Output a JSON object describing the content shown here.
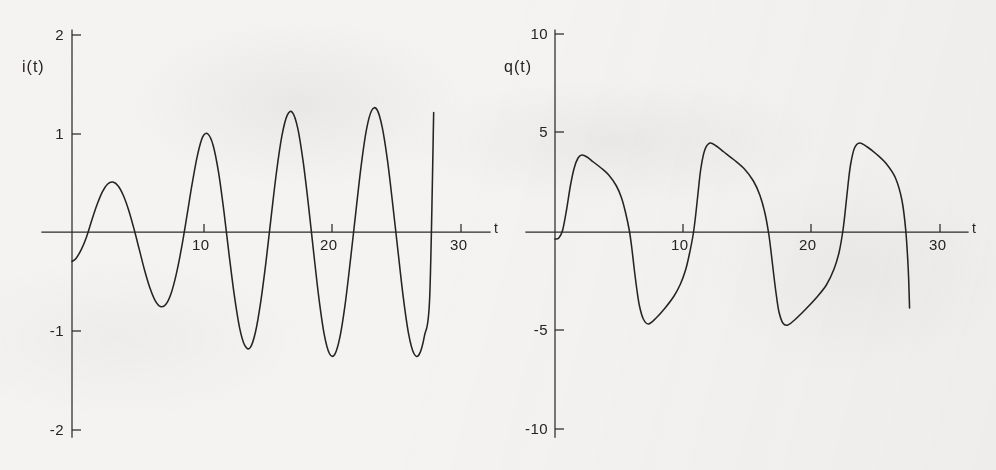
{
  "figure": {
    "background_color": "#f4f3f1",
    "ink_color": "#262422",
    "panel_count": 2
  },
  "panels": [
    {
      "id": "current",
      "ylabel": "i(t)",
      "xlabel": "t",
      "y_ticks": [
        "2",
        "1",
        "-1",
        "-2"
      ],
      "x_ticks": [
        "10",
        "20",
        "30"
      ]
    },
    {
      "id": "charge",
      "ylabel": "q(t)",
      "xlabel": "t",
      "y_ticks": [
        "10",
        "5",
        "-5",
        "-10"
      ],
      "x_ticks": [
        "10",
        "20",
        "30"
      ]
    }
  ],
  "chart_data": [
    {
      "type": "line",
      "id": "current-waveform",
      "title": "",
      "xlabel": "t",
      "ylabel": "i(t)",
      "xlim": [
        0,
        31
      ],
      "ylim": [
        -2,
        2
      ],
      "x_ticks": [
        10,
        20,
        30
      ],
      "y_ticks": [
        2,
        1,
        -1,
        -2
      ],
      "grid": false,
      "legend": "none",
      "series": [
        {
          "name": "i(t)",
          "comment": "growing oscillation settling to steady amplitude ~1.22, period ~6.9",
          "x": [
            0.0,
            0.3,
            0.7,
            1.1,
            1.5,
            1.9,
            2.3,
            2.7,
            3.1,
            3.5,
            3.9,
            4.3,
            4.7,
            5.1,
            5.5,
            5.9,
            6.3,
            6.7,
            7.1,
            7.5,
            7.9,
            8.3,
            8.7,
            9.1,
            9.5,
            9.9,
            10.3,
            10.7,
            11.1,
            11.5,
            11.9,
            12.3,
            12.7,
            13.1,
            13.5,
            13.9,
            14.3,
            14.7,
            15.1,
            15.5,
            15.9,
            16.3,
            16.7,
            17.1,
            17.5,
            17.9,
            18.3,
            18.7,
            19.1,
            19.5,
            19.9,
            20.3,
            20.7,
            21.1,
            21.5,
            21.9,
            22.3,
            22.7,
            23.1,
            23.5,
            23.9,
            24.3,
            24.7,
            25.1,
            25.5,
            25.9,
            26.3,
            26.7,
            27.1,
            27.4
          ],
          "y": [
            -0.3,
            -0.27,
            -0.18,
            -0.05,
            0.12,
            0.28,
            0.41,
            0.49,
            0.51,
            0.47,
            0.37,
            0.22,
            0.03,
            -0.18,
            -0.39,
            -0.57,
            -0.7,
            -0.76,
            -0.74,
            -0.63,
            -0.43,
            -0.16,
            0.16,
            0.49,
            0.78,
            0.97,
            1.0,
            0.88,
            0.61,
            0.22,
            -0.23,
            -0.65,
            -0.98,
            -1.16,
            -1.18,
            -1.02,
            -0.71,
            -0.3,
            0.17,
            0.62,
            0.98,
            1.19,
            1.22,
            1.06,
            0.73,
            0.29,
            -0.2,
            -0.67,
            -1.04,
            -1.24,
            -1.25,
            -1.07,
            -0.73,
            -0.28,
            0.2,
            0.67,
            1.04,
            1.24,
            1.25,
            1.07,
            0.73,
            0.28,
            -0.2,
            -0.67,
            -1.04,
            -1.24,
            -1.25,
            -1.06,
            -0.66,
            1.22
          ]
        }
      ]
    },
    {
      "type": "line",
      "id": "charge-waveform",
      "title": "",
      "xlabel": "t",
      "ylabel": "q(t)",
      "xlim": [
        0,
        31
      ],
      "ylim": [
        -10,
        10
      ],
      "x_ticks": [
        10,
        20,
        30
      ],
      "y_ticks": [
        10,
        5,
        -5,
        -10
      ],
      "grid": false,
      "legend": "none",
      "series": [
        {
          "name": "q(t)",
          "comment": "relaxation oscillation: fast rise to ~+4.5, slow decay, fast fall to ~-4.7, slow recovery; period ~11.3",
          "x": [
            0.0,
            0.3,
            0.6,
            0.9,
            1.2,
            1.5,
            1.8,
            2.1,
            2.5,
            3.0,
            3.6,
            4.2,
            4.8,
            5.2,
            5.5,
            5.8,
            6.0,
            6.2,
            6.4,
            6.6,
            6.9,
            7.3,
            7.9,
            8.6,
            9.3,
            9.8,
            10.2,
            10.5,
            10.8,
            11.0,
            11.2,
            11.4,
            11.7,
            12.1,
            12.6,
            13.2,
            14.0,
            14.8,
            15.5,
            16.0,
            16.4,
            16.7,
            16.9,
            17.1,
            17.3,
            17.5,
            17.8,
            18.2,
            18.8,
            19.6,
            20.4,
            21.2,
            21.8,
            22.2,
            22.5,
            22.7,
            22.9,
            23.1,
            23.4,
            23.8,
            24.4,
            25.1,
            25.9,
            26.6,
            27.1,
            27.4,
            27.6,
            27.7
          ],
          "y": [
            -0.35,
            -0.3,
            0.1,
            1.1,
            2.3,
            3.2,
            3.7,
            3.85,
            3.75,
            3.5,
            3.2,
            2.85,
            2.3,
            1.7,
            1.0,
            0.1,
            -0.8,
            -1.9,
            -2.9,
            -3.7,
            -4.35,
            -4.6,
            -4.3,
            -3.8,
            -3.2,
            -2.6,
            -1.9,
            -1.1,
            -0.1,
            0.9,
            2.1,
            3.2,
            4.1,
            4.45,
            4.3,
            4.0,
            3.6,
            3.15,
            2.55,
            1.85,
            0.95,
            -0.1,
            -1.1,
            -2.2,
            -3.2,
            -4.0,
            -4.55,
            -4.65,
            -4.35,
            -3.85,
            -3.3,
            -2.65,
            -1.85,
            -1.0,
            0.1,
            1.2,
            2.4,
            3.4,
            4.2,
            4.45,
            4.25,
            3.9,
            3.4,
            2.7,
            1.6,
            0.1,
            -1.9,
            -3.8
          ]
        }
      ]
    }
  ]
}
